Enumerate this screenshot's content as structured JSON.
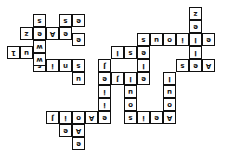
{
  "puzzle": {
    "type": "crossword",
    "orientation": "upside-down",
    "cells": [
      {
        "r": 0,
        "c": 14,
        "ch": "z"
      },
      {
        "r": 1,
        "c": 14,
        "ch": "e"
      },
      {
        "r": 2,
        "c": 10,
        "ch": "s"
      },
      {
        "r": 2,
        "c": 11,
        "ch": "u"
      },
      {
        "r": 2,
        "c": 12,
        "ch": "o"
      },
      {
        "r": 2,
        "c": 13,
        "ch": "i"
      },
      {
        "r": 2,
        "c": 14,
        "ch": "l"
      },
      {
        "r": 2,
        "c": 15,
        "ch": "e"
      },
      {
        "r": 3,
        "c": 8,
        "ch": "l"
      },
      {
        "r": 3,
        "c": 9,
        "ch": "s"
      },
      {
        "r": 3,
        "c": 10,
        "ch": "e"
      },
      {
        "r": 3,
        "c": 14,
        "ch": "l"
      },
      {
        "r": 4,
        "c": 7,
        "ch": "J"
      },
      {
        "r": 4,
        "c": 10,
        "ch": "l"
      },
      {
        "r": 4,
        "c": 13,
        "ch": "s"
      },
      {
        "r": 4,
        "c": 14,
        "ch": "e"
      },
      {
        "r": 4,
        "c": 15,
        "ch": "A"
      },
      {
        "r": 5,
        "c": 7,
        "ch": "e"
      },
      {
        "r": 5,
        "c": 8,
        "ch": "J"
      },
      {
        "r": 5,
        "c": 9,
        "ch": "l"
      },
      {
        "r": 5,
        "c": 10,
        "ch": "e"
      },
      {
        "r": 5,
        "c": 12,
        "ch": "l"
      },
      {
        "r": 6,
        "c": 7,
        "ch": "i"
      },
      {
        "r": 6,
        "c": 9,
        "ch": "u"
      },
      {
        "r": 6,
        "c": 12,
        "ch": "u"
      },
      {
        "r": 7,
        "c": 7,
        "ch": "i"
      },
      {
        "r": 7,
        "c": 9,
        "ch": "o"
      },
      {
        "r": 7,
        "c": 12,
        "ch": "o"
      },
      {
        "r": 8,
        "c": 3,
        "ch": "J"
      },
      {
        "r": 8,
        "c": 4,
        "ch": "i"
      },
      {
        "r": 8,
        "c": 5,
        "ch": "o"
      },
      {
        "r": 8,
        "c": 6,
        "ch": "A"
      },
      {
        "r": 8,
        "c": 7,
        "ch": "e"
      },
      {
        "r": 8,
        "c": 9,
        "ch": "s"
      },
      {
        "r": 8,
        "c": 10,
        "ch": "i"
      },
      {
        "r": 8,
        "c": 11,
        "ch": "e"
      },
      {
        "r": 8,
        "c": 12,
        "ch": "A"
      },
      {
        "r": 9,
        "c": 4,
        "ch": "e"
      },
      {
        "r": 9,
        "c": 5,
        "ch": "A"
      },
      {
        "r": 10,
        "c": 5,
        "ch": "e"
      },
      {
        "r": 4,
        "c": 2,
        "ch": "s"
      },
      {
        "r": 4,
        "c": 3,
        "ch": "i"
      },
      {
        "r": 4,
        "c": 4,
        "ch": "n"
      },
      {
        "r": 4,
        "c": 5,
        "ch": "s"
      },
      {
        "r": 5,
        "c": 5,
        "ch": "u"
      },
      {
        "r": 3,
        "c": 0,
        "ch": "1"
      },
      {
        "r": 3,
        "c": 1,
        "ch": "u"
      },
      {
        "r": 3,
        "c": 2,
        "ch": "o"
      },
      {
        "r": 2,
        "c": 5,
        "ch": "e"
      }
    ],
    "top_left_cluster": [
      {
        "r": 0,
        "c": 2,
        "ch": "s"
      },
      {
        "r": 0,
        "c": 4,
        "ch": "s"
      },
      {
        "r": 0,
        "c": 5,
        "ch": "e"
      },
      {
        "r": 1,
        "c": 1,
        "ch": "z"
      },
      {
        "r": 1,
        "c": 2,
        "ch": "e"
      },
      {
        "r": 1,
        "c": 3,
        "ch": "A"
      },
      {
        "r": 1,
        "c": 4,
        "ch": "e"
      },
      {
        "r": 2,
        "c": 2,
        "ch": "w"
      },
      {
        "r": 3,
        "c": 2,
        "ch": "w"
      }
    ]
  }
}
